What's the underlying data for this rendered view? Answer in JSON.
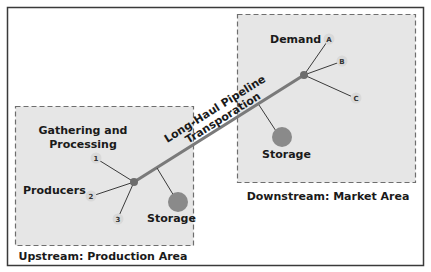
{
  "diagram": {
    "upstream": {
      "area_label": "Upstream: Production Area",
      "gathering_label_line1": "Gathering and",
      "gathering_label_line2": "Processing",
      "producers_label": "Producers",
      "storage_label": "Storage",
      "producer_nodes": [
        "1",
        "2",
        "3"
      ]
    },
    "downstream": {
      "area_label": "Downstream: Market Area",
      "demand_label": "Demand",
      "storage_label": "Storage",
      "demand_nodes": [
        "A",
        "B",
        "C"
      ]
    },
    "pipeline": {
      "label_line1": "Long-Haul Pipeline",
      "label_line2": "Transporation"
    },
    "colors": {
      "area_fill": "#e6e6e6",
      "dash_border": "#6e6e6e",
      "pipeline": "#7a7a7a",
      "hub": "#6d6d6d",
      "storage": "#8a8a8a",
      "node_fill": "#d9d9d9",
      "frame": "#3a3a3a"
    }
  }
}
